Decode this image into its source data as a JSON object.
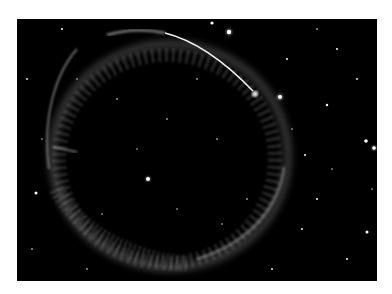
{
  "image": {
    "subject": "supernova remnant shell in starfield",
    "background_color": "#000000",
    "frame_color": "#ffffff",
    "shell_color": "#d8d8d8"
  }
}
